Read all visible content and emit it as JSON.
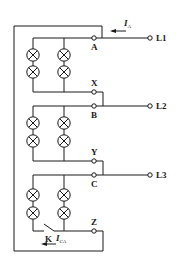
{
  "diagram": {
    "type": "three-phase lamp load circuit with switch",
    "line_color": "#1a1a1a",
    "background": "#ffffff",
    "lines": [
      {
        "label": "L1"
      },
      {
        "label": "L2"
      },
      {
        "label": "L3"
      }
    ],
    "terminals": [
      {
        "label": "A"
      },
      {
        "label": "X"
      },
      {
        "label": "B"
      },
      {
        "label": "Y"
      },
      {
        "label": "C"
      },
      {
        "label": "Z"
      }
    ],
    "switch": {
      "label": "K"
    },
    "currents": {
      "line_current": {
        "symbol": "I",
        "subscript": "A"
      },
      "phase_current": {
        "symbol": "I",
        "subscript": "CA"
      }
    },
    "lamp_groups": [
      {
        "phase": "A-X",
        "lamps": 4
      },
      {
        "phase": "B-Y",
        "lamps": 4
      },
      {
        "phase": "C-Z",
        "lamps": 4
      }
    ]
  }
}
